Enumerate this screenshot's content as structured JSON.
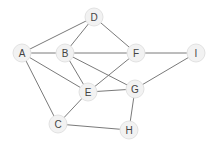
{
  "graph": {
    "node_radius": 9,
    "colors": {
      "background": "#ffffff",
      "edge": "#7a7a7a",
      "node_fill": "#f2f2f2",
      "node_stroke": "#e2e2e2",
      "label": "#444444"
    },
    "nodes": [
      {
        "id": "A",
        "label": "A",
        "x": 22,
        "y": 53
      },
      {
        "id": "B",
        "label": "B",
        "x": 65,
        "y": 53
      },
      {
        "id": "C",
        "label": "C",
        "x": 58,
        "y": 124
      },
      {
        "id": "D",
        "label": "D",
        "x": 94,
        "y": 17
      },
      {
        "id": "E",
        "label": "E",
        "x": 88,
        "y": 92
      },
      {
        "id": "F",
        "label": "F",
        "x": 136,
        "y": 53
      },
      {
        "id": "G",
        "label": "G",
        "x": 135,
        "y": 89
      },
      {
        "id": "H",
        "label": "H",
        "x": 129,
        "y": 130
      },
      {
        "id": "I",
        "label": "I",
        "x": 196,
        "y": 53
      }
    ],
    "edges": [
      [
        "A",
        "D"
      ],
      [
        "A",
        "B"
      ],
      [
        "A",
        "E"
      ],
      [
        "A",
        "C"
      ],
      [
        "D",
        "B"
      ],
      [
        "D",
        "F"
      ],
      [
        "B",
        "F"
      ],
      [
        "B",
        "E"
      ],
      [
        "B",
        "G"
      ],
      [
        "F",
        "E"
      ],
      [
        "F",
        "I"
      ],
      [
        "I",
        "G"
      ],
      [
        "E",
        "G"
      ],
      [
        "E",
        "C"
      ],
      [
        "C",
        "H"
      ],
      [
        "G",
        "H"
      ]
    ]
  }
}
